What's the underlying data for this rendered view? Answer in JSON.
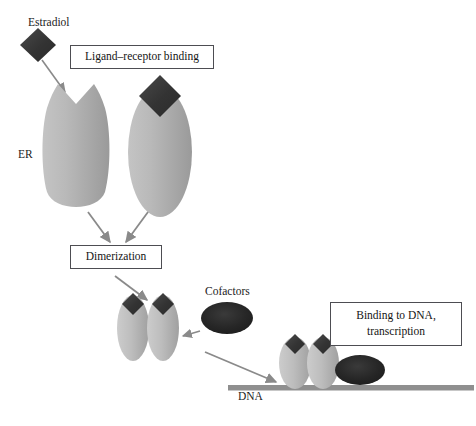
{
  "diagram": {
    "labels": {
      "estradiol": "Estradiol",
      "er": "ER",
      "cofactors": "Cofactors",
      "dna": "DNA"
    },
    "boxes": {
      "ligand_receptor_binding": "Ligand–receptor binding",
      "dimerization": "Dimerization",
      "binding_to_dna_line1": "Binding to DNA,",
      "binding_to_dna_line2": "transcription"
    },
    "colors": {
      "receptor_fill_light": "#c9c9c9",
      "receptor_fill_dark": "#9d9d9d",
      "ligand_diamond": "#3a3a3a",
      "cofactor_ellipse": "#262626",
      "dna_bar": "#8f8f8f",
      "arrow": "#8a8a8a",
      "box_border": "#4d4d52",
      "text": "#141414",
      "background": "#ffffff"
    },
    "steps": [
      "Estradiol ligand approaches unbound ER",
      "Ligand–receptor binding",
      "Dimerization of two ligand-bound receptors",
      "Cofactors recruited to the receptor dimer",
      "Binding to DNA, transcription"
    ]
  }
}
